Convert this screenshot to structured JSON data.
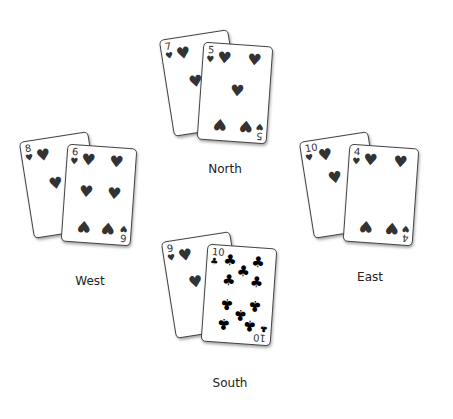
{
  "players": [
    {
      "name": "North",
      "cards": [
        {
          "rank": "7",
          "suit": "♥"
        },
        {
          "rank": "5",
          "suit": "♥"
        }
      ]
    },
    {
      "name": "West",
      "cards": [
        {
          "rank": "8",
          "suit": "♥"
        },
        {
          "rank": "6",
          "suit": "♥"
        }
      ]
    },
    {
      "name": "East",
      "cards": [
        {
          "rank": "10",
          "suit": "♥"
        },
        {
          "rank": "4",
          "suit": "♥"
        }
      ]
    },
    {
      "name": "South",
      "cards": [
        {
          "rank": "9",
          "suit": "♥"
        },
        {
          "rank": "10",
          "suit": "♣"
        }
      ]
    }
  ],
  "colors": {
    "pip": "#333333",
    "club": "#000000",
    "label": "#222222"
  }
}
